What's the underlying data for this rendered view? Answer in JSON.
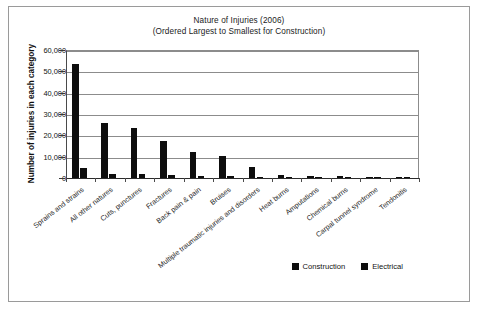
{
  "chart_data": {
    "type": "bar",
    "title": "Nature of Injuries (2006)",
    "subtitle": "(Ordered Largest to Smallest for Construction)",
    "xlabel": "",
    "ylabel": "Number of injuries in each category",
    "ylim": [
      0,
      60000
    ],
    "yticks": [
      "0",
      "10,000",
      "20,000",
      "30,000",
      "40,000",
      "50,000",
      "60,000"
    ],
    "ytick_values": [
      0,
      10000,
      20000,
      30000,
      40000,
      50000,
      60000
    ],
    "grid": true,
    "legend_position": "bottom-right",
    "categories": [
      "Sprains and strains",
      "All other natures",
      "Cuts, punctures",
      "Fractures",
      "Back pain & pain",
      "Bruises",
      "Multiple traumatic injuries and disorders",
      "Heat burns",
      "Amputations",
      "Chemical burns",
      "Carpal tunnel syndrome",
      "Tendonitis"
    ],
    "series": [
      {
        "name": "Construction",
        "color": "#0d0d0d",
        "values": [
          53400,
          25800,
          23600,
          17300,
          12400,
          10500,
          5100,
          1500,
          900,
          800,
          500,
          300
        ]
      },
      {
        "name": "Electrical",
        "color": "#0d0d0d",
        "values": [
          4600,
          2100,
          2000,
          1300,
          1000,
          800,
          400,
          150,
          120,
          100,
          80,
          60
        ]
      }
    ]
  },
  "legend": {
    "items": [
      {
        "label": "Construction"
      },
      {
        "label": "Electrical"
      }
    ]
  }
}
